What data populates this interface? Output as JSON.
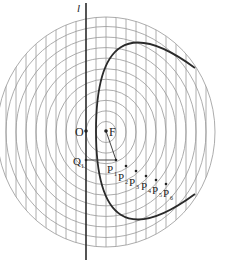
{
  "diagram": {
    "type": "parabola-construction",
    "directrix_label": "l",
    "origin_label": "O",
    "focus_label": "F",
    "q_label": "Q",
    "q_sub": "1",
    "points": [
      {
        "label": "P",
        "sub": "1"
      },
      {
        "label": "P",
        "sub": "2"
      },
      {
        "label": "P",
        "sub": "3"
      },
      {
        "label": "P",
        "sub": "4"
      },
      {
        "label": "P",
        "sub": "5"
      },
      {
        "label": "P",
        "sub": "6"
      }
    ],
    "colors": {
      "grid": "#9a9a9a",
      "curve": "#2a2a2a",
      "text": "#222222"
    }
  }
}
